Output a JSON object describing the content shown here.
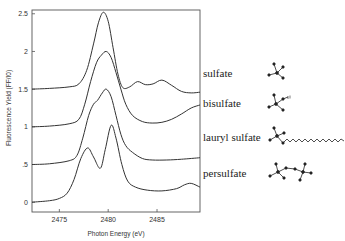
{
  "chart_data": {
    "type": "line",
    "title": "",
    "xlabel": "Photon Energy (eV)",
    "ylabel": "Fluorescence Yield (FF/I0)",
    "xlim": [
      2472.2,
      2489.4
    ],
    "ylim": [
      -0.13,
      2.55
    ],
    "grid": false,
    "legend_position": "inline-right",
    "x_ticks": [
      2475,
      2480,
      2485
    ],
    "x_tick_labels": [
      "2475",
      "2480",
      "2485"
    ],
    "y_ticks": [
      0,
      0.5,
      1,
      1.5,
      2,
      2.5
    ],
    "y_tick_labels": [
      "0",
      ".5",
      "1",
      "1.5",
      "2",
      "2.5"
    ],
    "series": [
      {
        "name": "sulfate",
        "x": [
          2472.2,
          2474,
          2476,
          2477,
          2477.8,
          2478.5,
          2479,
          2479.5,
          2480,
          2480.5,
          2481,
          2481.5,
          2482.2,
          2483,
          2483.8,
          2484.6,
          2485.5,
          2486.5,
          2487.5,
          2488.5,
          2489.4
        ],
        "values": [
          1.5,
          1.51,
          1.53,
          1.57,
          1.75,
          2.1,
          2.38,
          2.52,
          2.4,
          2.05,
          1.7,
          1.52,
          1.53,
          1.6,
          1.56,
          1.57,
          1.62,
          1.55,
          1.47,
          1.45,
          1.46
        ]
      },
      {
        "name": "bisulfate",
        "x": [
          2472.2,
          2474,
          2476,
          2477,
          2477.6,
          2478.2,
          2478.8,
          2479.3,
          2479.8,
          2480.3,
          2480.8,
          2481.3,
          2481.8,
          2482.5,
          2483.5,
          2484.5,
          2485.5,
          2486.5,
          2487.5,
          2488.5,
          2489.4
        ],
        "values": [
          1.0,
          1.01,
          1.04,
          1.1,
          1.3,
          1.6,
          1.85,
          1.95,
          2.0,
          1.92,
          1.72,
          1.5,
          1.3,
          1.15,
          1.07,
          1.05,
          1.06,
          1.1,
          1.17,
          1.25,
          1.29
        ]
      },
      {
        "name": "lauryl sulfate",
        "x": [
          2472.2,
          2474,
          2476,
          2476.8,
          2477.4,
          2478,
          2478.5,
          2478.9,
          2479.4,
          2479.8,
          2480.3,
          2480.8,
          2481.3,
          2481.8,
          2482.5,
          2483.5,
          2484.5,
          2486,
          2487.5,
          2489.4
        ],
        "values": [
          0.5,
          0.51,
          0.55,
          0.62,
          0.85,
          1.15,
          1.3,
          1.35,
          1.45,
          1.5,
          1.4,
          1.15,
          0.9,
          0.75,
          0.66,
          0.58,
          0.56,
          0.56,
          0.57,
          0.59
        ]
      },
      {
        "name": "persulfate",
        "x": [
          2472.2,
          2474,
          2475,
          2475.8,
          2476.5,
          2477.2,
          2477.9,
          2478.5,
          2479.2,
          2479.7,
          2480.3,
          2480.8,
          2481.4,
          2482,
          2482.8,
          2484,
          2485.5,
          2487,
          2487.8,
          2488.5,
          2489.4
        ],
        "values": [
          0.0,
          0.02,
          0.05,
          0.12,
          0.3,
          0.58,
          0.72,
          0.6,
          0.45,
          0.7,
          1.02,
          0.85,
          0.5,
          0.28,
          0.2,
          0.16,
          0.15,
          0.18,
          0.23,
          0.25,
          0.2
        ]
      }
    ],
    "annotations": [
      {
        "text": "sulfate",
        "structure": "SO4 tetrahedron"
      },
      {
        "text": "bisulfate",
        "structure": "HSO4 tetrahedron with H"
      },
      {
        "text": "lauryl sulfate",
        "structure": "sulfate head with long alkyl chain"
      },
      {
        "text": "persulfate",
        "structure": "two linked sulfate tetrahedra"
      }
    ]
  },
  "labels": {
    "xlabel": "Photon Energy (eV)",
    "ylabel": "Fluorescence Yield (FF/I0)",
    "series_names": [
      "sulfate",
      "bisulfate",
      "lauryl sulfate",
      "persulfate"
    ]
  }
}
